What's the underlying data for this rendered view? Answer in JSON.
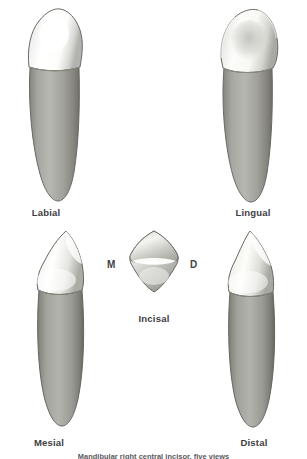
{
  "figure": {
    "background_color": "#ffffff",
    "enamel_color": "#f7f7f5",
    "enamel_shadow_color": "#b9b9b7",
    "root_color": "#9a9a98",
    "root_shadow_color": "#6f6f6d",
    "outline_color": "#5d5d5b",
    "label_color": "#3e3e42"
  },
  "views": [
    {
      "id": "labial",
      "label": "Labial",
      "description": "Labial (facial) view of the crown and root"
    },
    {
      "id": "lingual",
      "label": "Lingual",
      "description": "Lingual view showing the lingual fossa"
    },
    {
      "id": "incisal",
      "label": "Incisal",
      "description": "Incisal view looking down on the incisal edge"
    },
    {
      "id": "mesial",
      "label": "Mesial",
      "description": "Mesial proximal view"
    },
    {
      "id": "distal",
      "label": "Distal",
      "description": "Distal proximal view"
    }
  ],
  "orientation_markers": [
    {
      "id": "mesial-marker",
      "label": "M"
    },
    {
      "id": "distal-marker",
      "label": "D"
    }
  ],
  "caption": {
    "text": "Mandibular right central incisor, five views",
    "note": "cropped at image edge"
  }
}
